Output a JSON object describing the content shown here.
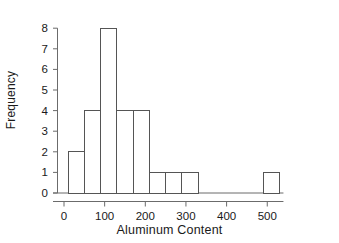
{
  "chart_data": {
    "type": "bar",
    "subtype": "histogram",
    "title": "",
    "xlabel": "Aluminum Content",
    "ylabel": "Frequency",
    "xlim": [
      0,
      530
    ],
    "ylim": [
      0,
      8
    ],
    "xticks": [
      0,
      100,
      200,
      300,
      400,
      500
    ],
    "xtick_labels": [
      "0",
      "100",
      "200",
      "300",
      "400",
      "500"
    ],
    "yticks": [
      0,
      1,
      2,
      3,
      4,
      5,
      6,
      7,
      8
    ],
    "ytick_labels": [
      "0",
      "1",
      "2",
      "3",
      "4",
      "5",
      "6",
      "7",
      "8"
    ],
    "grid": false,
    "legend": false,
    "bin_width": 40,
    "bin_edges": [
      10,
      50,
      90,
      130,
      170,
      210,
      250,
      290,
      330,
      490,
      530
    ],
    "bars": [
      {
        "left": 10,
        "right": 50,
        "value": 2
      },
      {
        "left": 50,
        "right": 90,
        "value": 4
      },
      {
        "left": 90,
        "right": 130,
        "value": 8
      },
      {
        "left": 130,
        "right": 170,
        "value": 4
      },
      {
        "left": 170,
        "right": 210,
        "value": 4
      },
      {
        "left": 210,
        "right": 250,
        "value": 1
      },
      {
        "left": 250,
        "right": 290,
        "value": 1
      },
      {
        "left": 290,
        "right": 330,
        "value": 1
      },
      {
        "left": 490,
        "right": 530,
        "value": 1
      }
    ],
    "categories": [
      "10-50",
      "50-90",
      "90-130",
      "130-170",
      "170-210",
      "210-250",
      "250-290",
      "290-330",
      "490-530"
    ],
    "values": [
      2,
      4,
      8,
      4,
      4,
      1,
      1,
      1,
      1
    ],
    "total_count": 26,
    "bar_fill_color": "#ffffff",
    "bar_edge_color": "#555555",
    "axis_color": "#6b6b6b",
    "text_color": "#1a1a1a",
    "background_color": "#ffffff"
  }
}
